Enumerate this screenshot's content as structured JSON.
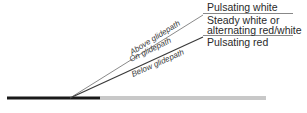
{
  "zones": [
    {
      "id": "above",
      "label": "Pulsating white"
    },
    {
      "id": "on",
      "label_line1": "Steady white or",
      "label_line2": "alternating red/white"
    },
    {
      "id": "below",
      "label": "Pulsating red"
    }
  ],
  "beam_labels": {
    "above": "Above glidepath",
    "on": "On glidepath",
    "below": "Below glidepath"
  },
  "colors": {
    "upper_beam": "#8a8a8a",
    "lower_beam": "#3a3a3a",
    "runway_dark": "#1a1a1a",
    "runway_light": "#c8c8c8",
    "rule": "#6a6a6a",
    "text": "#2a2a2a"
  }
}
